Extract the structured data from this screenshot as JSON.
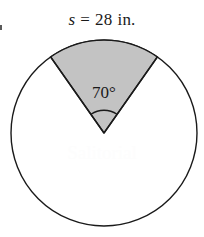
{
  "figure": {
    "type": "geometry-diagram",
    "shape": "circle-with-shaded-sector",
    "arc_length_label": {
      "symbol": "s",
      "equals": "=",
      "value": "28",
      "unit": "in.",
      "full_text": "s = 28 in."
    },
    "angle_label": {
      "value": "70",
      "degree_symbol": "°",
      "full_text": "70°"
    },
    "watermark_text": "Salitorial",
    "colors": {
      "sector_fill": "#c3c3c3",
      "stroke": "#1a1a1a",
      "background": "#ffffff",
      "watermark": "#fdfdfd"
    },
    "geometry": {
      "center_x": 104,
      "center_y": 133,
      "radius": 93,
      "sector_start_angle_deg": -125,
      "sector_end_angle_deg": -55,
      "sector_sweep_deg": 70,
      "angle_marker_radius": 23
    }
  }
}
